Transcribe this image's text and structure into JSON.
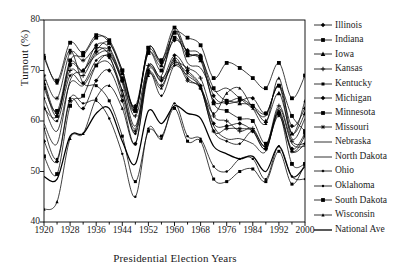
{
  "chart_data": {
    "type": "line",
    "title": "",
    "xlabel": "Presidential Election Years",
    "ylabel": "Turnout (%)",
    "xlim": [
      1920,
      2000
    ],
    "ylim": [
      40,
      80
    ],
    "ytick_labels": [
      "40",
      "50",
      "60",
      "70",
      "80"
    ],
    "ytick_values": [
      40,
      50,
      60,
      70,
      80
    ],
    "xtick_labels": [
      "1920",
      "1928",
      "1936",
      "1944",
      "1952",
      "1960",
      "1968",
      "1976",
      "1984",
      "1992",
      "2000"
    ],
    "xtick_values": [
      1920,
      1928,
      1936,
      1944,
      1952,
      1960,
      1968,
      1976,
      1984,
      1992,
      2000
    ],
    "minor_xticks": [
      1924,
      1932,
      1940,
      1948,
      1956,
      1964,
      1972,
      1980,
      1988,
      1996
    ],
    "grid": false,
    "legend_position": "right",
    "x": [
      1920,
      1924,
      1928,
      1932,
      1936,
      1940,
      1944,
      1948,
      1952,
      1956,
      1960,
      1964,
      1968,
      1972,
      1976,
      1980,
      1984,
      1988,
      1992,
      1996,
      2000
    ],
    "series": [
      {
        "name": "Illinois",
        "marker": "diamond",
        "values": [
          62.5,
          61.0,
          71.0,
          70.0,
          75.0,
          74.5,
          68.5,
          63.0,
          74.0,
          71.5,
          76.0,
          74.0,
          73.0,
          65.0,
          63.5,
          64.0,
          64.5,
          61.5,
          67.0,
          59.0,
          62.5
        ]
      },
      {
        "name": "Indiana",
        "marker": "square",
        "values": [
          72.5,
          68.0,
          75.5,
          73.5,
          77.0,
          75.5,
          70.0,
          62.5,
          73.5,
          70.0,
          76.5,
          73.0,
          72.5,
          63.5,
          62.0,
          60.5,
          60.0,
          55.5,
          61.5,
          51.5,
          51.5
        ]
      },
      {
        "name": "Iowa",
        "marker": "triangle",
        "values": [
          67.5,
          61.0,
          71.5,
          70.0,
          74.0,
          75.5,
          69.5,
          62.5,
          73.5,
          71.0,
          77.5,
          73.5,
          72.0,
          64.0,
          64.0,
          63.5,
          63.0,
          60.0,
          65.5,
          57.5,
          61.5
        ]
      },
      {
        "name": "Kansas",
        "marker": "plus",
        "values": [
          68.0,
          61.5,
          70.0,
          69.0,
          73.5,
          74.0,
          68.0,
          61.0,
          71.0,
          68.5,
          71.5,
          70.5,
          68.5,
          61.0,
          60.0,
          58.0,
          58.5,
          55.0,
          63.0,
          56.0,
          55.5
        ]
      },
      {
        "name": "Kentucky",
        "marker": "square-small",
        "values": [
          73.0,
          67.5,
          74.0,
          67.5,
          67.0,
          64.0,
          57.0,
          48.0,
          58.0,
          57.0,
          62.5,
          56.0,
          56.0,
          48.5,
          48.0,
          50.0,
          50.5,
          48.0,
          54.0,
          47.5,
          51.5
        ]
      },
      {
        "name": "Michigan",
        "marker": "diamond",
        "values": [
          56.0,
          52.0,
          64.0,
          62.5,
          68.0,
          70.0,
          64.0,
          55.5,
          70.0,
          68.0,
          73.0,
          70.0,
          67.0,
          59.5,
          59.0,
          59.5,
          58.0,
          54.5,
          61.5,
          54.5,
          57.5
        ]
      },
      {
        "name": "Minnesota",
        "marker": "square",
        "values": [
          53.0,
          49.5,
          63.0,
          65.0,
          71.0,
          73.0,
          68.0,
          62.0,
          74.5,
          72.0,
          77.5,
          76.5,
          75.0,
          68.5,
          71.5,
          70.5,
          68.5,
          66.5,
          71.5,
          64.5,
          69.0
        ]
      },
      {
        "name": "Missouri",
        "marker": "star",
        "values": [
          69.0,
          64.5,
          73.5,
          72.0,
          74.5,
          73.0,
          65.0,
          58.0,
          69.5,
          67.0,
          72.0,
          68.0,
          66.5,
          58.0,
          58.5,
          58.5,
          58.0,
          54.5,
          62.0,
          54.0,
          57.0
        ]
      },
      {
        "name": "Nebraska",
        "marker": "none",
        "values": [
          63.0,
          58.0,
          67.5,
          67.0,
          71.0,
          71.5,
          66.0,
          58.5,
          70.5,
          68.0,
          71.0,
          69.0,
          66.5,
          59.0,
          56.5,
          56.5,
          55.5,
          54.0,
          62.5,
          55.5,
          55.0
        ]
      },
      {
        "name": "North Dakota",
        "marker": "none",
        "values": [
          59.5,
          55.5,
          68.0,
          70.0,
          73.0,
          73.5,
          67.5,
          59.0,
          71.0,
          69.0,
          78.0,
          71.5,
          70.5,
          66.0,
          66.5,
          64.5,
          62.5,
          61.0,
          67.0,
          56.5,
          60.5
        ]
      },
      {
        "name": "Ohio",
        "marker": "diamond-small",
        "values": [
          64.5,
          60.0,
          69.0,
          67.5,
          72.0,
          72.5,
          66.0,
          57.5,
          69.5,
          65.0,
          71.0,
          69.5,
          66.5,
          58.0,
          56.0,
          55.5,
          58.0,
          55.0,
          61.0,
          54.0,
          55.5
        ]
      },
      {
        "name": "Oklahoma",
        "marker": "line-dot",
        "values": [
          58.5,
          52.5,
          64.5,
          63.5,
          64.0,
          60.5,
          53.5,
          45.0,
          58.5,
          56.5,
          63.5,
          57.0,
          56.5,
          51.0,
          50.0,
          52.5,
          52.5,
          48.5,
          55.0,
          49.0,
          48.5
        ]
      },
      {
        "name": "South Dakota",
        "marker": "square",
        "values": [
          66.5,
          62.0,
          72.0,
          73.0,
          76.5,
          76.0,
          70.0,
          62.0,
          74.5,
          72.0,
          78.5,
          73.5,
          72.5,
          66.5,
          64.0,
          64.5,
          63.0,
          61.5,
          67.0,
          61.0,
          58.0
        ]
      },
      {
        "name": "Wisconsin",
        "marker": "triangle-small",
        "values": [
          42.5,
          44.0,
          56.5,
          57.5,
          64.5,
          67.0,
          62.5,
          55.5,
          69.0,
          66.5,
          72.5,
          68.5,
          66.5,
          61.5,
          65.5,
          66.5,
          62.5,
          59.5,
          68.5,
          57.5,
          64.0
        ]
      },
      {
        "name": "National Ave",
        "marker": "none",
        "values": [
          49.0,
          48.5,
          57.0,
          57.5,
          61.5,
          62.5,
          56.0,
          51.5,
          62.0,
          59.5,
          63.0,
          61.5,
          60.5,
          55.0,
          53.5,
          52.5,
          53.0,
          50.0,
          55.0,
          49.0,
          51.0
        ]
      }
    ]
  },
  "legend": {
    "items": [
      {
        "label": "Illinois"
      },
      {
        "label": "Indiana"
      },
      {
        "label": "Iowa"
      },
      {
        "label": "Kansas"
      },
      {
        "label": "Kentucky"
      },
      {
        "label": "Michigan"
      },
      {
        "label": "Minnesota"
      },
      {
        "label": "Missouri"
      },
      {
        "label": "Nebraska"
      },
      {
        "label": "North Dakota"
      },
      {
        "label": "Ohio"
      },
      {
        "label": "Oklahoma"
      },
      {
        "label": "South Dakota"
      },
      {
        "label": "Wisconsin"
      },
      {
        "label": "National Ave"
      }
    ]
  },
  "colors": {
    "line": "#000000",
    "axis": "#000000",
    "background": "#ffffff"
  }
}
